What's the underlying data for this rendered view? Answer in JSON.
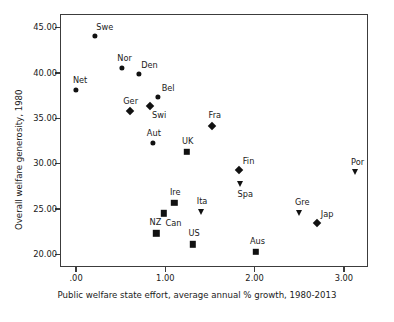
{
  "chart_data": {
    "type": "scatter",
    "title": "",
    "xlabel": "Public welfare state effort, average annual % growth, 1980-2013",
    "ylabel": "Overall welfare generosity, 1980",
    "xlim": [
      -0.18,
      3.27
    ],
    "ylim": [
      18.6,
      46.5
    ],
    "grid": false,
    "legend": "none",
    "xticks": [
      ".00",
      "1.00",
      "2.00",
      "3.00"
    ],
    "xtick_values": [
      0.0,
      1.0,
      2.0,
      3.0
    ],
    "yticks": [
      "45.00",
      "40.00",
      "35.00",
      "30.00",
      "25.00",
      "20.00"
    ],
    "ytick_values": [
      45.0,
      40.0,
      35.0,
      30.0,
      25.0,
      20.0
    ],
    "marker_color": "#111111",
    "frame_color": "#3c3c3c",
    "points": [
      {
        "label": "Swe",
        "x": 0.21,
        "y": 44.1,
        "marker": "circle",
        "label_dx": 10,
        "label_dy": -9
      },
      {
        "label": "Nor",
        "x": 0.51,
        "y": 40.6,
        "marker": "circle",
        "label_dx": 3,
        "label_dy": -10
      },
      {
        "label": "Den",
        "x": 0.7,
        "y": 39.9,
        "marker": "circle",
        "label_dx": 11,
        "label_dy": -9
      },
      {
        "label": "Net",
        "x": 0.0,
        "y": 38.1,
        "marker": "circle",
        "label_dx": 4,
        "label_dy": -10
      },
      {
        "label": "Bel",
        "x": 0.92,
        "y": 37.4,
        "marker": "circle",
        "label_dx": 10,
        "label_dy": -9
      },
      {
        "label": "Ger",
        "x": 0.6,
        "y": 35.8,
        "marker": "diamond",
        "label_dx": 1,
        "label_dy": -10
      },
      {
        "label": "Swi",
        "x": 0.83,
        "y": 36.3,
        "marker": "diamond",
        "label_dx": 9,
        "label_dy": 9
      },
      {
        "label": "Fra",
        "x": 1.52,
        "y": 34.1,
        "marker": "diamond",
        "label_dx": 3,
        "label_dy": -11
      },
      {
        "label": "Aut",
        "x": 0.86,
        "y": 32.3,
        "marker": "circle",
        "label_dx": 1,
        "label_dy": -10
      },
      {
        "label": "UK",
        "x": 1.24,
        "y": 31.3,
        "marker": "square",
        "label_dx": 1,
        "label_dy": -11
      },
      {
        "label": "Fin",
        "x": 1.82,
        "y": 29.3,
        "marker": "diamond",
        "label_dx": 10,
        "label_dy": -9
      },
      {
        "label": "Por",
        "x": 3.12,
        "y": 29.1,
        "marker": "triangle",
        "label_dx": 3,
        "label_dy": -10
      },
      {
        "label": "Spa",
        "x": 1.84,
        "y": 27.8,
        "marker": "triangle",
        "label_dx": 5,
        "label_dy": 10
      },
      {
        "label": "Ire",
        "x": 1.1,
        "y": 25.7,
        "marker": "square",
        "label_dx": 1,
        "label_dy": -11
      },
      {
        "label": "Ita",
        "x": 1.4,
        "y": 24.7,
        "marker": "triangle",
        "label_dx": 1,
        "label_dy": -11
      },
      {
        "label": "Gre",
        "x": 2.5,
        "y": 24.5,
        "marker": "triangle",
        "label_dx": 3,
        "label_dy": -11
      },
      {
        "label": "Can",
        "x": 0.98,
        "y": 24.5,
        "marker": "square",
        "label_dx": 10,
        "label_dy": 10
      },
      {
        "label": "Jap",
        "x": 2.7,
        "y": 23.4,
        "marker": "diamond",
        "label_dx": 10,
        "label_dy": -9
      },
      {
        "label": "NZ",
        "x": 0.9,
        "y": 22.3,
        "marker": "square",
        "label_dx": -1,
        "label_dy": -11
      },
      {
        "label": "US",
        "x": 1.31,
        "y": 21.1,
        "marker": "square",
        "label_dx": 1,
        "label_dy": -11
      },
      {
        "label": "Aus",
        "x": 2.01,
        "y": 20.3,
        "marker": "square",
        "label_dx": 2,
        "label_dy": -11
      }
    ]
  }
}
